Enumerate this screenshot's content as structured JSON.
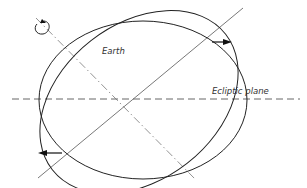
{
  "diagram": {
    "labels": {
      "earth": "Earth",
      "ecliptic_plane": "Ecliptic plane"
    },
    "icons": {
      "rotation_indicator": "rotation-arrow-icon",
      "torque_arrow_top": "arrow-right-icon",
      "torque_arrow_bottom": "arrow-left-icon"
    },
    "colors": {
      "stroke": "#222222",
      "dashed_line": "#555555",
      "axis_line": "#777777",
      "background": "#ffffff"
    }
  }
}
